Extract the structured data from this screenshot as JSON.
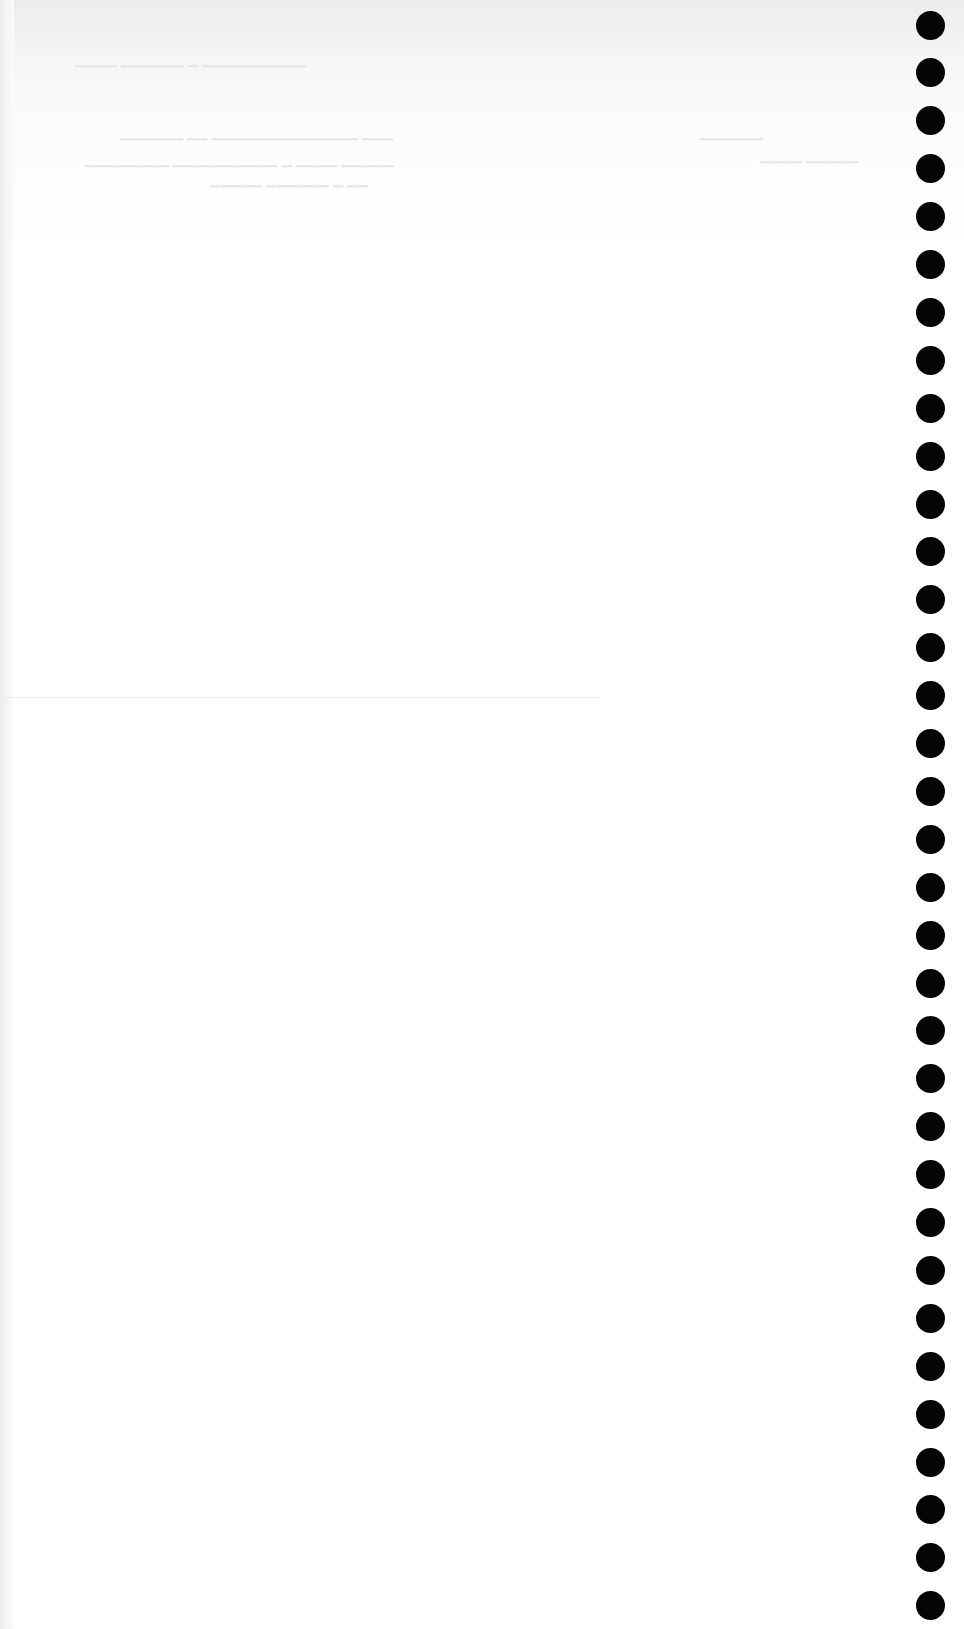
{
  "page": {
    "type": "scanned blank continuous-feed paper",
    "background_color": "#ffffff",
    "hole_color": "#050505"
  },
  "bleed_through_text": [
    {
      "id": "line1",
      "text": "",
      "x": 75,
      "y": 52
    },
    {
      "id": "line2",
      "text": "",
      "x": 120,
      "y": 125
    },
    {
      "id": "line3",
      "text": "",
      "x": 85,
      "y": 152
    },
    {
      "id": "line4",
      "text": "",
      "x": 210,
      "y": 172
    }
  ],
  "tractor_feed_holes": {
    "count": 34,
    "x_center": 930,
    "first_y_center": 25,
    "pitch": 47.9,
    "diameter": 29
  }
}
